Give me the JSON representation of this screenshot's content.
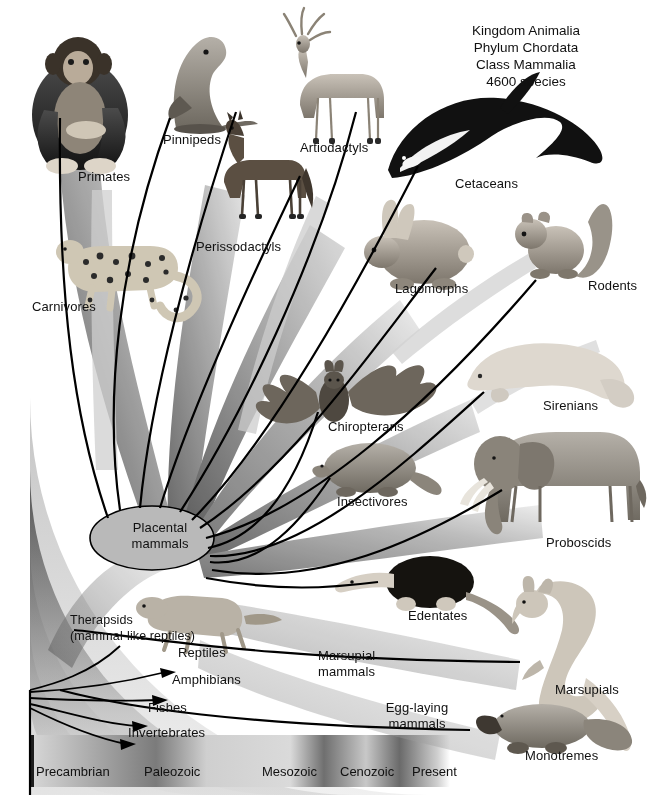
{
  "header": {
    "lines": [
      "Kingdom Animalia",
      "Phylum Chordata",
      "Class Mammalia",
      "4600 species"
    ]
  },
  "nodes": {
    "placental": "Placental\nmammals",
    "marsupial": "Marsupial\nmammals",
    "monotreme": "Egg-laying\nmammals",
    "therapsids": "Therapsids\n(mammal-like reptiles)"
  },
  "ancestors": [
    {
      "label": "Reptiles"
    },
    {
      "label": "Amphibians"
    },
    {
      "label": "Fishes"
    },
    {
      "label": "Invertebrates"
    }
  ],
  "orders": [
    {
      "label": "Primates",
      "animal": "chimpanzee"
    },
    {
      "label": "Pinnipeds",
      "animal": "sea-lion"
    },
    {
      "label": "Artiodactyls",
      "animal": "deer"
    },
    {
      "label": "Cetaceans",
      "animal": "orca"
    },
    {
      "label": "Perissodactyls",
      "animal": "horse"
    },
    {
      "label": "Carnivores",
      "animal": "leopard"
    },
    {
      "label": "Lagomorphs",
      "animal": "rabbit"
    },
    {
      "label": "Rodents",
      "animal": "squirrel"
    },
    {
      "label": "Chiropterans",
      "animal": "bat"
    },
    {
      "label": "Sirenians",
      "animal": "manatee"
    },
    {
      "label": "Insectivores",
      "animal": "mole"
    },
    {
      "label": "Proboscids",
      "animal": "elephant"
    },
    {
      "label": "Edentates",
      "animal": "anteater"
    },
    {
      "label": "Marsupials",
      "animal": "kangaroo"
    },
    {
      "label": "Monotremes",
      "animal": "platypus"
    }
  ],
  "timeline": {
    "eras": [
      {
        "label": "Precambrian"
      },
      {
        "label": "Paleozoic"
      },
      {
        "label": "Mesozoic"
      },
      {
        "label": "Cenozoic"
      },
      {
        "label": "Present"
      }
    ]
  },
  "colors": {
    "ink": "#111111",
    "page": "#ffffff",
    "band_dark": "#3d3d3d",
    "band_mid": "#8f8f8f",
    "band_light": "#d6d6d6",
    "node_fill": "#b9b9b9"
  }
}
